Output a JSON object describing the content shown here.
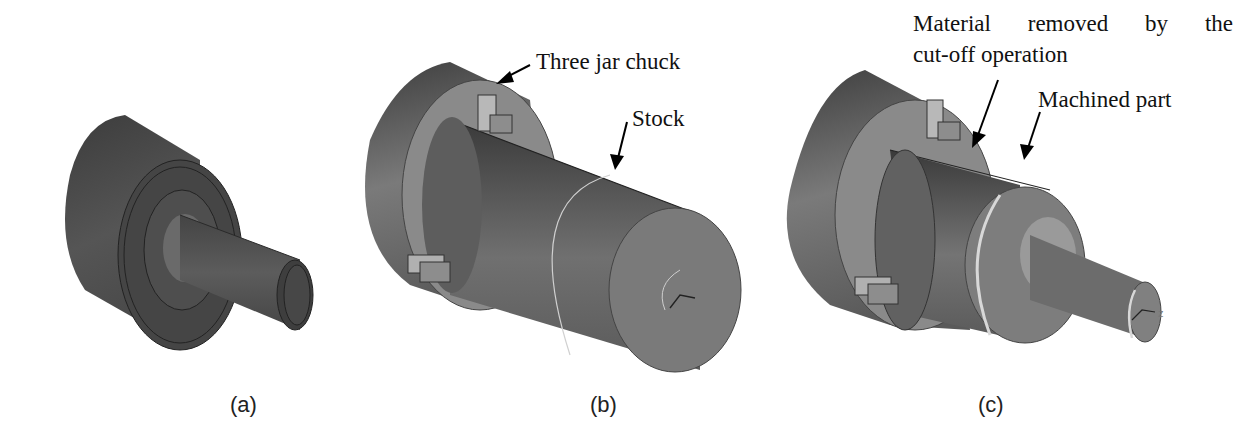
{
  "figure": {
    "panels": [
      {
        "id": "a",
        "caption": "(a)",
        "depicts": "finished-turned-part",
        "annotations": []
      },
      {
        "id": "b",
        "caption": "(b)",
        "depicts": "stock-in-three-jaw-chuck",
        "annotations": [
          {
            "label": "Three jar chuck",
            "target": "chuck"
          },
          {
            "label": "Stock",
            "target": "stock"
          }
        ]
      },
      {
        "id": "c",
        "caption": "(c)",
        "depicts": "machined-part-in-chuck",
        "annotations": [
          {
            "label_line1": "Material removed by the",
            "label_line2": "cut-off operation",
            "target": "cut-off-groove"
          },
          {
            "label": "Machined part",
            "target": "machined-part"
          }
        ],
        "axis_label": "z"
      }
    ],
    "colors": {
      "part_dark": "#3a3a3a",
      "part_mid": "#5a5a5a",
      "chuck_light": "#8a8a8a",
      "highlight": "#c8c8c8",
      "text": "#111111"
    }
  }
}
